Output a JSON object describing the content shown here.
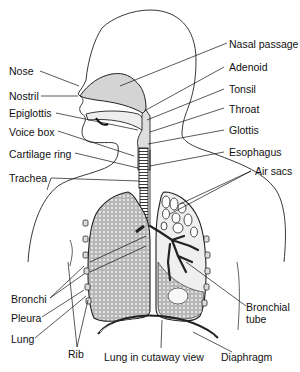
{
  "diagram": {
    "labels": {
      "nose": "Nose",
      "nostril": "Nostril",
      "epiglottis": "Epiglottis",
      "voice_box": "Voice box",
      "cartilage_ring": "Cartilage ring",
      "trachea": "Trachea",
      "nasal_passage": "Nasal passage",
      "adenoid": "Adenoid",
      "tonsil": "Tonsil",
      "throat": "Throat",
      "glottis": "Glottis",
      "esophagus": "Esophagus",
      "air_sacs": "Air sacs",
      "bronchi": "Bronchi",
      "pleura": "Pleura",
      "lung": "Lung",
      "rib": "Rib",
      "lung_cutaway": "Lung in cutaway view",
      "diaphragm": "Diaphragm",
      "bronchial_tube_line1": "Bronchial",
      "bronchial_tube_line2": "tube"
    },
    "colors": {
      "ink": "#111111",
      "lung_fill": "#c9c9c9",
      "nasal_fill": "#d4d4d4",
      "background": "#ffffff"
    }
  }
}
